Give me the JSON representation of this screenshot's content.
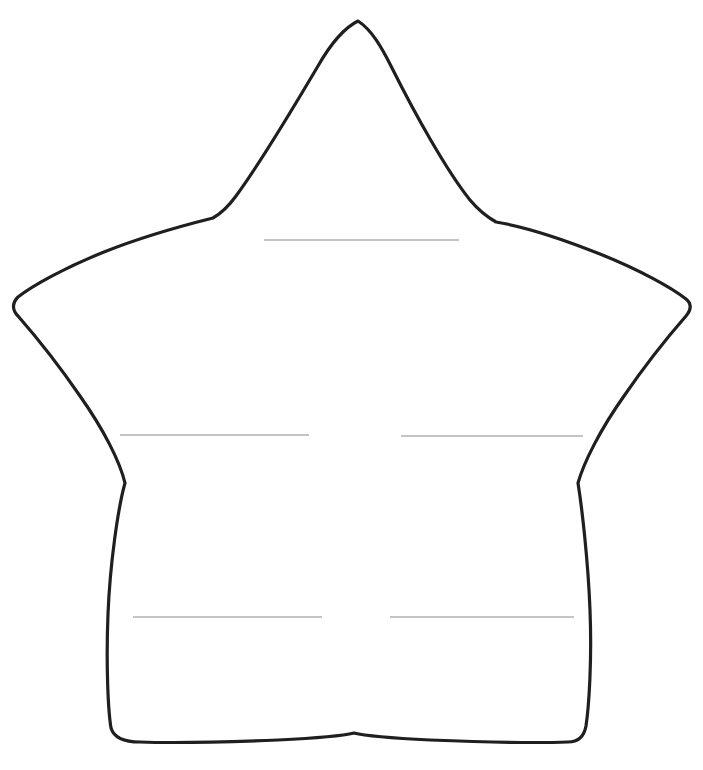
{
  "page": {
    "background_color": "#ffffff",
    "width": 703,
    "height": 770,
    "clipped_header_text": ""
  },
  "shape": {
    "name": "five-pointed-star",
    "style": "hand-drawn outline",
    "stroke_color": "#1f1f1f",
    "fill_color": "#ffffff",
    "stroke_width": "3.2",
    "path": "M 358 21 C 372 30 382 48 392 68 C 414 112 446 170 470 200 C 480 212 489 218 496 222 C 520 226 560 238 600 254 C 640 270 672 288 686 299 C 692 304 691 310 686 316 C 672 332 646 364 624 396 C 600 430 584 462 578 483 C 582 508 588 560 590 610 C 592 660 589 706 586 726 C 584 737 578 742 568 742 C 540 743 480 742 430 740 C 390 738 362 735 354 733 C 346 735 318 738 278 740 C 228 742 168 743 140 742 C 124 742 114 738 111 728 C 108 710 106 664 108 614 C 110 564 118 508 125 483 C 120 462 104 430 80 396 C 58 364 32 332 18 316 C 12 310 12 303 18 297 C 32 286 64 268 104 252 C 144 236 185 225 213 218 C 220 214 228 207 236 196 C 258 166 292 110 318 66 C 330 45 344 28 358 21 Z",
    "vertices": {
      "top_point": [
        358,
        21
      ],
      "upper_left_notch": [
        213,
        218
      ],
      "left_point": [
        14,
        299
      ],
      "lower_left_notch": [
        131,
        483
      ],
      "bottom_left_leg": [
        110,
        740
      ],
      "bottom_notch": [
        354,
        660
      ],
      "bottom_right_leg": [
        585,
        740
      ],
      "lower_right_notch": [
        578,
        483
      ],
      "right_point": [
        690,
        302
      ],
      "upper_right_notch": [
        496,
        222
      ]
    }
  },
  "writing_lines": {
    "color": "#8a8a8a",
    "count": 5,
    "lines": [
      {
        "id": "line-1",
        "label": "top-center-line",
        "x1": 264,
        "y1": 240,
        "x2": 459,
        "y2": 240
      },
      {
        "id": "line-2",
        "label": "middle-left-line",
        "x1": 120,
        "y1": 435,
        "x2": 309,
        "y2": 435
      },
      {
        "id": "line-3",
        "label": "middle-right-line",
        "x1": 401,
        "y1": 436,
        "x2": 583,
        "y2": 436
      },
      {
        "id": "line-4",
        "label": "bottom-left-line",
        "x1": 133,
        "y1": 617,
        "x2": 322,
        "y2": 617
      },
      {
        "id": "line-5",
        "label": "bottom-right-line",
        "x1": 390,
        "y1": 617,
        "x2": 574,
        "y2": 617
      }
    ]
  }
}
